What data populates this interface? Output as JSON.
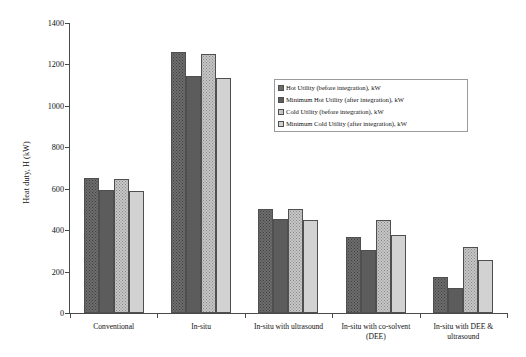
{
  "chart_data": {
    "type": "bar",
    "title": "",
    "xlabel": "",
    "ylabel": "Heat duty, H (kW)",
    "ylim": [
      0,
      1400
    ],
    "yticks": [
      0,
      200,
      400,
      600,
      800,
      1000,
      1200,
      1400
    ],
    "grid": false,
    "legend_position": "upper right inside",
    "categories": [
      "Conventional",
      "In-situ",
      "In-situ with ultrasound",
      "In-situ with co-solvent (DEE)",
      "In-situ with DEE & ultrasound"
    ],
    "series": [
      {
        "name": "Hot Utility (before integration), kW",
        "color": "#6d6d6d",
        "values": [
          650,
          1262,
          500,
          368,
          172
        ]
      },
      {
        "name": "Minimum Hot Utility (after integration), kW",
        "color": "#5c5c5c",
        "values": [
          595,
          1143,
          455,
          305,
          120
        ]
      },
      {
        "name": "Cold Utility (before integration), kW",
        "color": "#c6c6c6",
        "values": [
          648,
          1252,
          502,
          450,
          318
        ]
      },
      {
        "name": "Minimum Cold Utility (after integration), kW",
        "color": "#d2d2d2",
        "values": [
          588,
          1133,
          448,
          378,
          258
        ]
      }
    ]
  },
  "legend": {
    "items": [
      "Hot Utility (before integration), kW",
      "Minimum Hot Utility (after integration), kW",
      "Cold Utility (before integration), kW",
      "Minimum Cold Utility (after integration), kW"
    ]
  }
}
